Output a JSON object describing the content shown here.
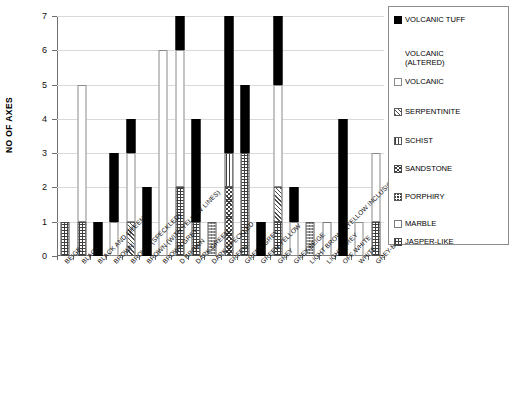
{
  "chart_data": {
    "type": "bar",
    "title": "",
    "xlabel": "",
    "ylabel": "NO OF AXES",
    "ylim": [
      0,
      7
    ],
    "yticks": [
      0,
      1,
      2,
      3,
      4,
      5,
      6,
      7
    ],
    "grid": true,
    "stacked": true,
    "legend_position": "right",
    "categories": [
      "BEIGE",
      "BLACK",
      "BLACK AND GREEN",
      "BROWN",
      "BROWN (SPECKLED)",
      "BROWN (WITH YELLOW LINES)",
      "BROWN GREY",
      "D BROWN",
      "DARK GREEN",
      "DARK SPECKLED",
      "GREEN",
      "GREEN GREY",
      "GREEN YELLOW",
      "GREY",
      "GREY-BEIGE",
      "LIGHT BROWN (YELLOW INCLUSIONS)",
      "LIGHT GREY",
      "OFF WHITE",
      "WHITE",
      "GREY-BLUE"
    ],
    "series": [
      {
        "name": "JASPER-LIKE",
        "key": "jasper",
        "values": [
          1,
          1,
          0,
          0,
          0,
          0,
          0,
          2,
          1,
          0,
          0,
          3,
          0,
          1,
          0,
          0,
          0,
          0,
          0,
          1
        ]
      },
      {
        "name": "MARBLE",
        "key": "marble",
        "values": [
          0,
          0,
          0,
          0,
          0,
          0,
          0,
          0,
          0,
          0,
          0,
          0,
          0,
          0,
          0,
          0,
          1,
          0,
          0,
          0
        ]
      },
      {
        "name": "PORPHIRY",
        "key": "porph",
        "values": [
          0,
          0,
          0,
          0,
          0,
          0,
          0,
          0,
          0,
          1,
          0,
          0,
          0,
          0,
          0,
          1,
          0,
          0,
          0,
          0
        ]
      },
      {
        "name": "SANDSTONE",
        "key": "sand",
        "values": [
          0,
          0,
          0,
          0,
          0,
          0,
          0,
          0,
          0,
          0,
          2,
          0,
          0,
          0,
          0,
          0,
          0,
          0,
          0,
          0
        ]
      },
      {
        "name": "SCHIST",
        "key": "schist",
        "values": [
          0,
          0,
          0,
          0,
          0,
          0,
          0,
          0,
          0,
          0,
          1,
          0,
          0,
          0,
          0,
          0,
          0,
          0,
          0,
          0
        ]
      },
      {
        "name": "SERPENTINITE",
        "key": "serp",
        "values": [
          0,
          0,
          0,
          0,
          1,
          0,
          0,
          0,
          0,
          0,
          0,
          0,
          0,
          1,
          0,
          0,
          0,
          0,
          0,
          0
        ]
      },
      {
        "name": "VOLCANIC",
        "key": "volc",
        "values": [
          0,
          4,
          0,
          1,
          2,
          0,
          6,
          4,
          0,
          0,
          0,
          0,
          0,
          3,
          1,
          0,
          0,
          0,
          1,
          2
        ]
      },
      {
        "name": "VOLCANIC (ALTERED)",
        "key": "volcalt",
        "values": [
          1,
          0,
          0,
          0,
          0,
          0,
          0,
          0,
          0,
          0,
          0,
          0,
          0,
          0,
          0,
          0,
          0,
          0,
          1,
          0
        ]
      },
      {
        "name": "VOLCANIC TUFF",
        "key": "tuff",
        "values": [
          0,
          0,
          1,
          2,
          1,
          2,
          0,
          1,
          3,
          0,
          4,
          2,
          1,
          2,
          1,
          0,
          0,
          4,
          0,
          0
        ]
      }
    ],
    "totals": [
      2,
      5,
      1,
      3,
      4,
      2,
      6,
      7,
      4,
      1,
      7,
      5,
      1,
      6,
      2,
      1,
      1,
      4,
      3,
      3
    ]
  },
  "axis": {
    "y_title": "NO OF AXES",
    "y_ticks": [
      "0",
      "1",
      "2",
      "3",
      "4",
      "5",
      "6",
      "7"
    ]
  },
  "legend": {
    "items": [
      {
        "label": "VOLCANIC TUFF",
        "swatch": "tuff"
      },
      {
        "label": "VOLCANIC\n (ALTERED)",
        "swatch": "volcalt"
      },
      {
        "label": "VOLCANIC",
        "swatch": "volc"
      },
      {
        "label": "SERPENTINITE",
        "swatch": "serp"
      },
      {
        "label": "SCHIST",
        "swatch": "schist"
      },
      {
        "label": "SANDSTONE",
        "swatch": "sand"
      },
      {
        "label": "PORPHIRY",
        "swatch": "porph"
      },
      {
        "label": "MARBLE",
        "swatch": "marble"
      },
      {
        "label": "JASPER-LIKE",
        "swatch": "jasper"
      }
    ]
  },
  "caption": ""
}
